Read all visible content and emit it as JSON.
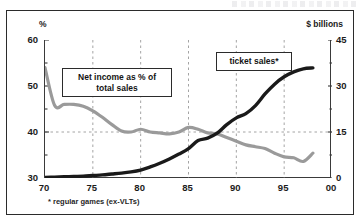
{
  "figure": {
    "left_axis_unit": "%",
    "right_axis_unit": "$ billions",
    "footnote": "* regular games (ex-VLTs)"
  },
  "callouts": {
    "net_income": "Net income as % of\ntotal sales",
    "net_income_line1": "Net income as % of",
    "net_income_line2": "total sales",
    "ticket_sales": "ticket sales*"
  },
  "colors": {
    "ticket_sales_line": "#1a1a1a",
    "net_income_line": "#9a9a9a",
    "frame": "#2b2b2b",
    "gridline": "#9a9a9a",
    "plot_background": "#ffffff"
  },
  "chart_data": {
    "type": "line",
    "title": "",
    "subtitle": "",
    "xlabel": "",
    "ylabel": "%",
    "y2label": "$ billions",
    "xlim": [
      70,
      100
    ],
    "ylim": [
      30,
      60
    ],
    "y2lim": [
      0,
      45
    ],
    "xticks": [
      70,
      75,
      80,
      85,
      90,
      95,
      100
    ],
    "xticklabels": [
      "70",
      "75",
      "80",
      "85",
      "90",
      "95",
      "00"
    ],
    "yticks": [
      30,
      40,
      50,
      60
    ],
    "yticklabels": [
      "30",
      "40",
      "50",
      "60"
    ],
    "y2ticks": [
      0,
      15,
      30,
      45
    ],
    "y2ticklabels": [
      "0",
      "15",
      "30",
      "45"
    ],
    "y_minor_ticks": [
      35,
      45,
      55
    ],
    "y2_minor_ticks": [
      7.5,
      22.5,
      37.5
    ],
    "grid": "dashed gridlines at y=40 (left axis) and vertical at x=75,80,85,90,95",
    "gridlines_x": [
      75,
      80,
      85,
      90,
      95
    ],
    "gridlines_y": [
      40
    ],
    "legend_position": "inline callout boxes",
    "annotations": [
      {
        "text": "Net income as % of total sales",
        "series": "net_income_pct_of_total_sales",
        "x": 78,
        "y": 52
      },
      {
        "text": "ticket sales*",
        "series": "ticket_sales_billions",
        "x": 92,
        "y": 56
      }
    ],
    "x": [
      70,
      71,
      72,
      73,
      74,
      75,
      76,
      77,
      78,
      79,
      80,
      81,
      82,
      83,
      84,
      85,
      86,
      87,
      88,
      89,
      90,
      91,
      92,
      93,
      94,
      95,
      96,
      97,
      98
    ],
    "series": [
      {
        "name": "Net income as % of total sales",
        "key": "net_income_pct_of_total_sales",
        "axis": "left",
        "unit": "%",
        "color": "#9a9a9a",
        "values": [
          54.0,
          45.8,
          46.0,
          46.0,
          45.6,
          44.6,
          43.2,
          41.6,
          40.2,
          40.0,
          40.6,
          40.0,
          39.8,
          39.6,
          40.0,
          41.0,
          40.6,
          39.8,
          39.6,
          38.8,
          38.0,
          37.2,
          36.8,
          36.4,
          35.4,
          34.6,
          34.4,
          33.6,
          35.4
        ]
      },
      {
        "name": "ticket sales*",
        "key": "ticket_sales_billions",
        "axis": "right",
        "unit": "$ billions",
        "color": "#1a1a1a",
        "values": [
          0.2,
          0.3,
          0.4,
          0.5,
          0.6,
          0.8,
          1.0,
          1.3,
          1.6,
          2.0,
          2.6,
          3.6,
          4.8,
          6.2,
          7.8,
          9.6,
          12.2,
          13.0,
          14.6,
          17.4,
          19.6,
          21.0,
          23.6,
          27.4,
          30.6,
          33.0,
          34.6,
          35.6,
          35.9
        ]
      }
    ]
  }
}
